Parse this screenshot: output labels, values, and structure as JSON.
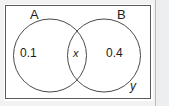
{
  "diagram": {
    "type": "venn",
    "universal_set": {
      "label": "S",
      "outside_region_value": "y"
    },
    "sets": [
      {
        "name": "A",
        "label": "A",
        "only_value": "0.1"
      },
      {
        "name": "B",
        "label": "B",
        "only_value": "0.4"
      }
    ],
    "intersection": {
      "label": "x",
      "value": "x"
    },
    "colors": {
      "circle_stroke": "#4a4a4a",
      "box_stroke": "#5a5a5a",
      "text": "#1d1d1d",
      "background": "#ffffff",
      "page_edge": "#eceef0"
    }
  }
}
